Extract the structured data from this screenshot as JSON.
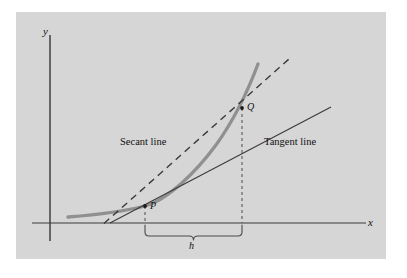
{
  "figure": {
    "background_color": "#d6d6d6",
    "page_color": "#ffffff",
    "panel": {
      "x": 16,
      "y": 12,
      "width": 370,
      "height": 247
    },
    "axes": {
      "x_label": "x",
      "y_label": "y",
      "x_axis_y": 223,
      "y_axis_x": 50,
      "axis_color": "#3a3a3a"
    },
    "labels": {
      "secant_line": "Secant line",
      "tangent_line": "Tangent line",
      "point_p": "P",
      "point_q": "Q",
      "interval_h": "h"
    },
    "points": {
      "P": {
        "x": 145,
        "y": 206
      },
      "Q": {
        "x": 242,
        "y": 108
      }
    },
    "curve": {
      "name": "function-curve",
      "color": "#8f8f8f",
      "width": 3.2,
      "path": "M 68,217 C 100,214 128,210 145,206 C 168,200 196,172 216,145 C 234,120 248,88 258,64"
    },
    "secant": {
      "name": "secant-line",
      "style": "dashed",
      "color": "#3a3a3a",
      "width": 1.4,
      "dash": "7,5",
      "x1": 104,
      "y1": 223,
      "x2": 289,
      "y2": 60
    },
    "tangent": {
      "name": "tangent-line",
      "style": "solid",
      "color": "#3a3a3a",
      "width": 1.1,
      "x1": 110,
      "y1": 223,
      "x2": 331,
      "y2": 107
    },
    "dropline_p": {
      "x": 145,
      "y_top": 206,
      "y_bottom": 223
    },
    "dropline_q": {
      "x": 242,
      "y_top": 108,
      "y_bottom": 223
    },
    "brace": {
      "x_left": 145,
      "x_right": 242,
      "y": 231,
      "depth": 8
    }
  }
}
